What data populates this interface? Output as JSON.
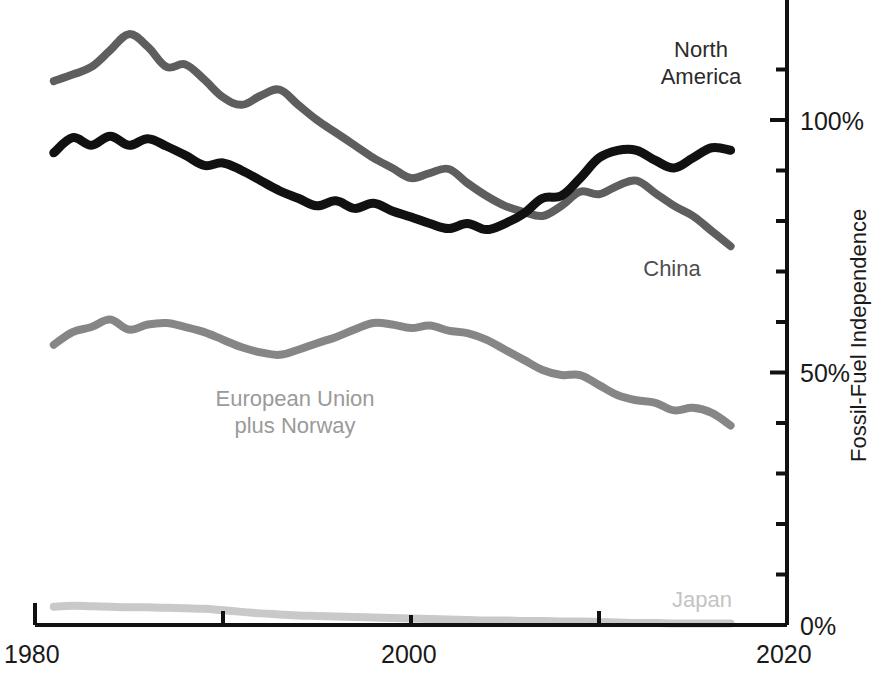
{
  "chart_data": {
    "type": "line",
    "title": "",
    "subtitle": "",
    "xlabel": "",
    "ylabel": "Fossil-Fuel Independence",
    "xlim": [
      1980,
      2020
    ],
    "ylim": [
      0,
      125
    ],
    "grid": false,
    "legend_position": "inline-labels",
    "x_tick_labels": [
      "1980",
      "2000",
      "2020"
    ],
    "x_tick_values": [
      1980,
      2000,
      2020
    ],
    "x_minor_tick_values": [
      1990,
      2010
    ],
    "y_tick_labels": [
      "0%",
      "50%",
      "100%"
    ],
    "y_tick_values": [
      0,
      50,
      100
    ],
    "y_minor_tick_values": [
      10,
      20,
      30,
      40,
      60,
      70,
      80,
      90,
      110
    ],
    "series": [
      {
        "name": "North America",
        "color": "#5e5e5e",
        "label_x": 1981,
        "x": [
          1981,
          1982,
          1983,
          1984,
          1985,
          1986,
          1987,
          1988,
          1989,
          1990,
          1991,
          1992,
          1993,
          1994,
          1995,
          1996,
          1997,
          1998,
          1999,
          2000,
          2001,
          2002,
          2003,
          2004,
          2005,
          2006,
          2007,
          2008,
          2009,
          2010,
          2011,
          2012,
          2013,
          2014,
          2015,
          2016,
          2017
        ],
        "values": [
          107.7,
          109.0,
          110.5,
          113.8,
          117.0,
          114.5,
          110.5,
          111.0,
          108.0,
          104.5,
          103.0,
          104.8,
          106.0,
          103.0,
          100.0,
          97.5,
          95.0,
          92.5,
          90.5,
          88.5,
          89.5,
          90.3,
          87.5,
          85.0,
          83.0,
          81.8,
          81.0,
          83.0,
          85.8,
          85.3,
          87.0,
          88.0,
          85.5,
          83.0,
          81.0,
          78.0,
          75.0
        ]
      },
      {
        "name": "China",
        "color": "#111111",
        "label_x": 2012,
        "x": [
          1981,
          1982,
          1983,
          1984,
          1985,
          1986,
          1987,
          1988,
          1989,
          1990,
          1991,
          1992,
          1993,
          1994,
          1995,
          1996,
          1997,
          1998,
          1999,
          2000,
          2001,
          2002,
          2003,
          2004,
          2005,
          2006,
          2007,
          2008,
          2009,
          2010,
          2011,
          2012,
          2013,
          2014,
          2015,
          2016,
          2017
        ],
        "values": [
          93.5,
          96.5,
          95.0,
          96.8,
          95.0,
          96.3,
          94.8,
          93.0,
          91.0,
          91.5,
          90.0,
          88.0,
          86.0,
          84.5,
          83.0,
          84.0,
          82.5,
          83.5,
          82.0,
          80.8,
          79.5,
          78.5,
          79.5,
          78.3,
          79.5,
          81.5,
          84.5,
          85.0,
          88.5,
          92.5,
          94.0,
          94.0,
          92.0,
          90.5,
          92.5,
          94.5,
          94.0
        ]
      },
      {
        "name": "European Union\nplus Norway",
        "color": "#868686",
        "label_x": 1996,
        "x": [
          1981,
          1982,
          1983,
          1984,
          1985,
          1986,
          1987,
          1988,
          1989,
          1990,
          1991,
          1992,
          1993,
          1994,
          1995,
          1996,
          1997,
          1998,
          1999,
          2000,
          2001,
          2002,
          2003,
          2004,
          2005,
          2006,
          2007,
          2008,
          2009,
          2010,
          2011,
          2012,
          2013,
          2014,
          2015,
          2016,
          2017
        ],
        "values": [
          55.5,
          58.0,
          59.0,
          60.5,
          58.5,
          59.5,
          59.8,
          59.0,
          58.0,
          56.5,
          55.0,
          54.0,
          53.5,
          54.5,
          55.8,
          57.0,
          58.5,
          59.8,
          59.5,
          58.8,
          59.3,
          58.3,
          57.8,
          56.5,
          54.5,
          52.5,
          50.5,
          49.5,
          49.5,
          47.5,
          45.5,
          44.5,
          44.0,
          42.5,
          43.0,
          42.0,
          39.5
        ]
      },
      {
        "name": "Japan",
        "color": "#c9c9c9",
        "label_x": 2013,
        "x": [
          1981,
          1982,
          1983,
          1984,
          1985,
          1986,
          1987,
          1988,
          1989,
          1990,
          1991,
          1992,
          1993,
          1994,
          1995,
          1996,
          1997,
          1998,
          1999,
          2000,
          2001,
          2002,
          2003,
          2004,
          2005,
          2006,
          2007,
          2008,
          2009,
          2010,
          2011,
          2012,
          2013,
          2014,
          2015,
          2016,
          2017
        ],
        "values": [
          3.6,
          3.8,
          3.7,
          3.6,
          3.5,
          3.5,
          3.4,
          3.3,
          3.2,
          2.9,
          2.6,
          2.3,
          2.1,
          1.9,
          1.8,
          1.7,
          1.6,
          1.5,
          1.4,
          1.3,
          1.2,
          1.1,
          1.0,
          0.9,
          0.9,
          0.8,
          0.8,
          0.7,
          0.7,
          0.6,
          0.5,
          0.4,
          0.4,
          0.3,
          0.3,
          0.3,
          0.3
        ]
      }
    ]
  },
  "axis": {
    "y_title": "Fossil-Fuel Independence",
    "color": "#111111"
  },
  "labels": {
    "north_america_line1": "North",
    "north_america_line2": "America",
    "china": "China",
    "eu_line1": "European Union",
    "eu_line2": "plus Norway",
    "japan": "Japan"
  },
  "ticks": {
    "x_1980": "1980",
    "x_2000": "2000",
    "x_2020": "2020",
    "y_0": "0%",
    "y_50": "50%",
    "y_100": "100%"
  }
}
